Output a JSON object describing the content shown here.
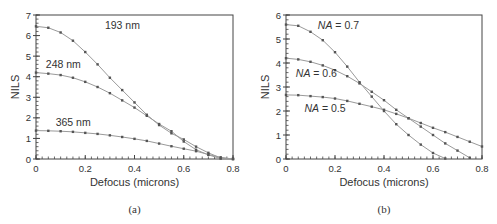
{
  "chart_data": [
    {
      "id": "a",
      "type": "line",
      "caption": "(a)",
      "title": "",
      "xlabel": "Defocus (microns)",
      "ylabel": "NILS",
      "xlim": [
        0,
        0.8
      ],
      "ylim": [
        0,
        7
      ],
      "xticks": [
        0,
        0.2,
        0.4,
        0.6,
        0.8
      ],
      "xtick_labels": [
        "0",
        "0.2",
        "0.4",
        "0.6",
        "0.8"
      ],
      "yticks": [
        0,
        1,
        2,
        3,
        4,
        5,
        6,
        7
      ],
      "ytick_labels": [
        "0",
        "1",
        "2",
        "3",
        "4",
        "5",
        "6",
        "7"
      ],
      "grid": false,
      "legend": "inline labels",
      "x": [
        0,
        0.05,
        0.1,
        0.15,
        0.2,
        0.25,
        0.3,
        0.35,
        0.4,
        0.45,
        0.5,
        0.55,
        0.6,
        0.65,
        0.7,
        0.75,
        0.8
      ],
      "series": [
        {
          "name": "193 nm",
          "label_pos": [
            0.28,
            6.3
          ],
          "values": [
            6.45,
            6.38,
            6.15,
            5.75,
            5.2,
            4.6,
            3.95,
            3.35,
            2.75,
            2.15,
            1.65,
            1.25,
            0.95,
            0.6,
            0.3,
            0.05,
            0
          ]
        },
        {
          "name": "248 nm",
          "label_pos": [
            0.04,
            4.4
          ],
          "values": [
            4.2,
            4.15,
            4.08,
            3.95,
            3.75,
            3.5,
            3.2,
            2.85,
            2.5,
            2.1,
            1.7,
            1.35,
            0.85,
            0.45,
            0.2,
            0.02,
            0
          ]
        },
        {
          "name": "365 nm",
          "label_pos": [
            0.08,
            1.6
          ],
          "values": [
            1.38,
            1.37,
            1.35,
            1.32,
            1.27,
            1.22,
            1.15,
            1.07,
            0.98,
            0.88,
            0.75,
            0.62,
            0.5,
            0.38,
            0.22,
            0.08,
            0
          ]
        }
      ]
    },
    {
      "id": "b",
      "type": "line",
      "caption": "(b)",
      "title": "",
      "xlabel": "Defocus (microns)",
      "ylabel": "NILS",
      "xlim": [
        0,
        0.8
      ],
      "ylim": [
        0,
        6
      ],
      "xticks": [
        0,
        0.2,
        0.4,
        0.6,
        0.8
      ],
      "xtick_labels": [
        "0",
        "0.2",
        "0.4",
        "0.6",
        "0.8"
      ],
      "yticks": [
        0,
        1,
        2,
        3,
        4,
        5,
        6
      ],
      "ytick_labels": [
        "0",
        "1",
        "2",
        "3",
        "4",
        "5",
        "6"
      ],
      "grid": false,
      "legend": "inline labels",
      "x": [
        0,
        0.05,
        0.1,
        0.15,
        0.2,
        0.25,
        0.3,
        0.35,
        0.4,
        0.45,
        0.5,
        0.55,
        0.6,
        0.65,
        0.7,
        0.75,
        0.8
      ],
      "series": [
        {
          "name": "NA = 0.7",
          "label_prefix": "NA",
          "label_suffix": " = 0.7",
          "label_pos": [
            0.13,
            5.4
          ],
          "values": [
            5.6,
            5.55,
            5.3,
            4.95,
            4.45,
            3.85,
            3.2,
            2.6,
            2.0,
            1.45,
            1.0,
            0.6,
            0.25,
            0.02,
            null,
            null,
            null
          ]
        },
        {
          "name": "NA = 0.6",
          "label_prefix": "NA",
          "label_suffix": " = 0.6",
          "label_pos": [
            0.04,
            3.4
          ],
          "values": [
            4.2,
            4.15,
            4.05,
            3.9,
            3.7,
            3.45,
            3.15,
            2.8,
            2.45,
            2.05,
            1.7,
            1.35,
            1.0,
            0.65,
            0.35,
            0.05,
            null
          ]
        },
        {
          "name": "NA = 0.5",
          "label_prefix": "NA",
          "label_suffix": " = 0.5",
          "label_pos": [
            0.075,
            1.95
          ],
          "values": [
            2.67,
            2.66,
            2.62,
            2.58,
            2.52,
            2.42,
            2.3,
            2.18,
            2.05,
            1.88,
            1.7,
            1.5,
            1.3,
            1.12,
            0.92,
            0.72,
            0.52
          ]
        }
      ]
    }
  ],
  "colors": {
    "line": "#9a9a9a",
    "marker": "#555555",
    "axis": "#444444",
    "text": "#333333"
  }
}
